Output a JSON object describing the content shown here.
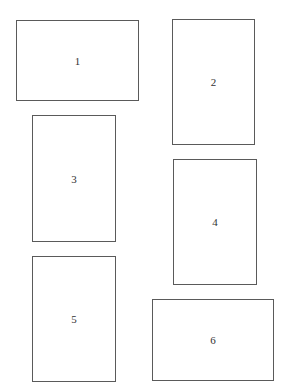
{
  "diagram": {
    "boxes": [
      {
        "label": "1",
        "x": 16,
        "y": 20,
        "w": 123,
        "h": 81
      },
      {
        "label": "2",
        "x": 172,
        "y": 19,
        "w": 83,
        "h": 126
      },
      {
        "label": "3",
        "x": 32,
        "y": 115,
        "w": 84,
        "h": 127
      },
      {
        "label": "4",
        "x": 173,
        "y": 159,
        "w": 84,
        "h": 126
      },
      {
        "label": "5",
        "x": 32,
        "y": 256,
        "w": 84,
        "h": 126
      },
      {
        "label": "6",
        "x": 152,
        "y": 299,
        "w": 122,
        "h": 82
      }
    ]
  }
}
